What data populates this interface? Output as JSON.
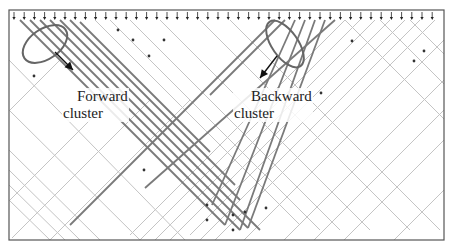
{
  "figure": {
    "frame": {
      "x": 9,
      "y": 10,
      "width": 435,
      "height": 230,
      "stroke": "#555555"
    },
    "arrow_row": {
      "y": 16,
      "start_x": 14,
      "spacing": 10.2,
      "count": 42,
      "color": "#222222"
    },
    "colors": {
      "light_line": "#c4c4c4",
      "mid_line": "#9a9a9a",
      "dark_line": "#7a7a7a",
      "ellipse": "#666666",
      "dot": "#333333"
    }
  },
  "labels": {
    "forward": {
      "line1": "Forward",
      "line2": "cluster"
    },
    "backward": {
      "line1": "Backward",
      "line2": "cluster"
    }
  },
  "annotations": {
    "forward_ellipse": {
      "cx": 45,
      "cy": 44,
      "rx": 25,
      "ry": 15,
      "rotate": -35
    },
    "forward_arrow": {
      "x1": 55,
      "y1": 52,
      "x2": 73,
      "y2": 70
    },
    "backward_ellipse": {
      "cx": 285,
      "cy": 44,
      "rx": 27,
      "ry": 13,
      "rotate": 55
    },
    "backward_arrow": {
      "x1": 277,
      "y1": 56,
      "x2": 260,
      "y2": 78
    }
  },
  "lines": {
    "forward_dark": [
      {
        "x1": 20,
        "y1": 20,
        "x2": 225,
        "y2": 225
      },
      {
        "x1": 30,
        "y1": 20,
        "x2": 240,
        "y2": 230
      },
      {
        "x1": 40,
        "y1": 20,
        "x2": 248,
        "y2": 228
      },
      {
        "x1": 50,
        "y1": 20,
        "x2": 260,
        "y2": 230
      },
      {
        "x1": 60,
        "y1": 20,
        "x2": 240,
        "y2": 200
      },
      {
        "x1": 70,
        "y1": 20,
        "x2": 235,
        "y2": 185
      },
      {
        "x1": 80,
        "y1": 22,
        "x2": 210,
        "y2": 152
      }
    ],
    "backward_dark": [
      {
        "x1": 275,
        "y1": 20,
        "x2": 70,
        "y2": 225
      },
      {
        "x1": 285,
        "y1": 20,
        "x2": 210,
        "y2": 95
      },
      {
        "x1": 295,
        "y1": 20,
        "x2": 212,
        "y2": 205
      },
      {
        "x1": 305,
        "y1": 20,
        "x2": 225,
        "y2": 225
      },
      {
        "x1": 315,
        "y1": 20,
        "x2": 240,
        "y2": 230
      },
      {
        "x1": 325,
        "y1": 20,
        "x2": 248,
        "y2": 228
      },
      {
        "x1": 335,
        "y1": 20,
        "x2": 145,
        "y2": 188
      }
    ],
    "light_down_right": [
      {
        "x1": 9,
        "y1": 60,
        "x2": 185,
        "y2": 240
      },
      {
        "x1": 9,
        "y1": 110,
        "x2": 140,
        "y2": 240
      },
      {
        "x1": 9,
        "y1": 150,
        "x2": 100,
        "y2": 240
      },
      {
        "x1": 9,
        "y1": 170,
        "x2": 80,
        "y2": 240
      },
      {
        "x1": 9,
        "y1": 185,
        "x2": 65,
        "y2": 240
      },
      {
        "x1": 9,
        "y1": 200,
        "x2": 50,
        "y2": 240
      },
      {
        "x1": 95,
        "y1": 20,
        "x2": 300,
        "y2": 225
      },
      {
        "x1": 110,
        "y1": 20,
        "x2": 320,
        "y2": 230
      },
      {
        "x1": 130,
        "y1": 20,
        "x2": 340,
        "y2": 230
      },
      {
        "x1": 160,
        "y1": 20,
        "x2": 370,
        "y2": 230
      },
      {
        "x1": 200,
        "y1": 20,
        "x2": 410,
        "y2": 230
      },
      {
        "x1": 230,
        "y1": 20,
        "x2": 440,
        "y2": 230
      },
      {
        "x1": 345,
        "y1": 20,
        "x2": 444,
        "y2": 119
      },
      {
        "x1": 380,
        "y1": 20,
        "x2": 444,
        "y2": 84
      },
      {
        "x1": 410,
        "y1": 20,
        "x2": 444,
        "y2": 54
      }
    ],
    "light_down_left": [
      {
        "x1": 60,
        "y1": 60,
        "x2": 9,
        "y2": 111
      },
      {
        "x1": 100,
        "y1": 110,
        "x2": 9,
        "y2": 201
      },
      {
        "x1": 150,
        "y1": 100,
        "x2": 12,
        "y2": 238
      },
      {
        "x1": 190,
        "y1": 100,
        "x2": 50,
        "y2": 240
      },
      {
        "x1": 345,
        "y1": 20,
        "x2": 130,
        "y2": 235
      },
      {
        "x1": 360,
        "y1": 20,
        "x2": 140,
        "y2": 240
      },
      {
        "x1": 375,
        "y1": 20,
        "x2": 155,
        "y2": 240
      },
      {
        "x1": 390,
        "y1": 20,
        "x2": 170,
        "y2": 240
      },
      {
        "x1": 405,
        "y1": 20,
        "x2": 190,
        "y2": 235
      },
      {
        "x1": 420,
        "y1": 20,
        "x2": 200,
        "y2": 240
      },
      {
        "x1": 435,
        "y1": 20,
        "x2": 215,
        "y2": 240
      },
      {
        "x1": 444,
        "y1": 40,
        "x2": 244,
        "y2": 240
      },
      {
        "x1": 444,
        "y1": 80,
        "x2": 284,
        "y2": 240
      },
      {
        "x1": 444,
        "y1": 110,
        "x2": 314,
        "y2": 240
      },
      {
        "x1": 444,
        "y1": 140,
        "x2": 344,
        "y2": 240
      },
      {
        "x1": 444,
        "y1": 190,
        "x2": 394,
        "y2": 240
      }
    ]
  },
  "dots": [
    {
      "x": 34,
      "y": 76
    },
    {
      "x": 118,
      "y": 30
    },
    {
      "x": 133,
      "y": 40
    },
    {
      "x": 149,
      "y": 56
    },
    {
      "x": 164,
      "y": 40
    },
    {
      "x": 144,
      "y": 170
    },
    {
      "x": 207,
      "y": 205
    },
    {
      "x": 207,
      "y": 220
    },
    {
      "x": 233,
      "y": 230
    },
    {
      "x": 233,
      "y": 215
    },
    {
      "x": 245,
      "y": 212
    },
    {
      "x": 266,
      "y": 208
    },
    {
      "x": 321,
      "y": 93
    },
    {
      "x": 352,
      "y": 41
    },
    {
      "x": 414,
      "y": 61
    },
    {
      "x": 424,
      "y": 51
    }
  ]
}
